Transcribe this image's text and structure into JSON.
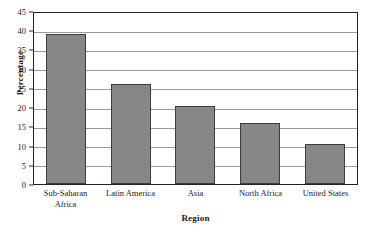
{
  "chart_data": {
    "type": "bar",
    "title": "",
    "subtitle": "",
    "xlabel": "Region",
    "ylabel": "Percentage",
    "categories": [
      "Sub-Saharan\nAfrica",
      "Latin America",
      "Asia",
      "North Africa",
      "United States"
    ],
    "values": [
      39,
      26,
      20.2,
      16,
      10.5
    ],
    "ylim": [
      0,
      45
    ],
    "ytick_values": [
      0,
      5,
      10,
      15,
      20,
      25,
      30,
      35,
      40,
      45
    ],
    "ytick_labels": [
      "0",
      "5",
      "10",
      "15",
      "20",
      "25",
      "30",
      "35",
      "40",
      "45"
    ],
    "grid": true,
    "grid_axis": "y",
    "legend": false,
    "legend_position": "none",
    "series": [
      {
        "name": "Percentage",
        "values": [
          39,
          26,
          20.2,
          16,
          10.5
        ]
      }
    ]
  },
  "style": {
    "bar_fill": "#878787",
    "bar_stroke": "#3d3d3d",
    "frame_stroke": "#232323",
    "grid_stroke": "#9a9a9a",
    "background": "#ffffff",
    "text_color": "#1a1a1a"
  }
}
